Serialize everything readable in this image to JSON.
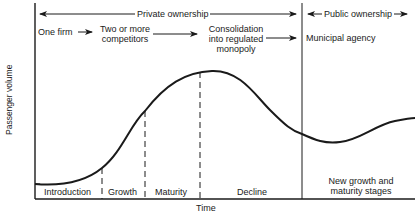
{
  "diagram": {
    "y_axis_label": "Passenger volume",
    "x_axis_label": "Time",
    "ownership": {
      "private": "Private ownership",
      "public": "Public ownership"
    },
    "structure_stages": {
      "one_firm": "One firm",
      "competitors_line1": "Two or more",
      "competitors_line2": "competitors",
      "consolidation_line1": "Consolidation",
      "consolidation_line2": "into regulated",
      "consolidation_line3": "monopoly",
      "municipal": "Municipal agency"
    },
    "lifecycle_stages": {
      "introduction": "Introduction",
      "growth": "Growth",
      "maturity": "Maturity",
      "decline": "Decline",
      "new_growth_line1": "New growth and",
      "new_growth_line2": "maturity stages"
    },
    "colors": {
      "line": "#1a1a1a",
      "background": "#ffffff"
    }
  }
}
